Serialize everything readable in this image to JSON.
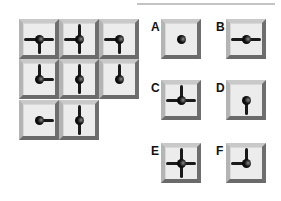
{
  "puzzle": {
    "grid": [
      {
        "row": 0,
        "col": 0,
        "arms": [
          "left",
          "right",
          "down"
        ]
      },
      {
        "row": 0,
        "col": 1,
        "arms": [
          "left",
          "up",
          "down"
        ]
      },
      {
        "row": 0,
        "col": 2,
        "arms": [
          "left",
          "down"
        ]
      },
      {
        "row": 1,
        "col": 0,
        "arms": [
          "up",
          "right"
        ]
      },
      {
        "row": 1,
        "col": 1,
        "arms": [
          "up",
          "down"
        ]
      },
      {
        "row": 1,
        "col": 2,
        "arms": [
          "up"
        ]
      },
      {
        "row": 2,
        "col": 0,
        "arms": [
          "right"
        ]
      },
      {
        "row": 2,
        "col": 1,
        "arms": [
          "up",
          "down"
        ]
      }
    ],
    "missing_cell": {
      "row": 2,
      "col": 2
    },
    "options": [
      {
        "label": "A",
        "arms": []
      },
      {
        "label": "B",
        "arms": [
          "left",
          "right"
        ]
      },
      {
        "label": "C",
        "arms": [
          "left",
          "right",
          "up"
        ]
      },
      {
        "label": "D",
        "arms": [
          "down"
        ]
      },
      {
        "label": "E",
        "arms": [
          "left",
          "right",
          "up",
          "down"
        ]
      },
      {
        "label": "F",
        "arms": [
          "left",
          "up"
        ]
      }
    ]
  },
  "colors": {
    "tile_face": "#ececec",
    "bevel_light": "#c9c9c9",
    "bevel_dark": "#6e6e6e",
    "arm": "#1a1a1a"
  }
}
